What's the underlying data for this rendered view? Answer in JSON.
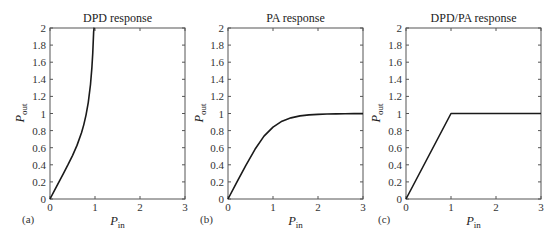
{
  "figure": {
    "background": "#ffffff",
    "curve_color": "#1a1a1a",
    "axis_color": "#555555"
  },
  "chart_data": [
    {
      "panel": "(a)",
      "type": "line",
      "title": "DPD response",
      "xlabel": "P_in",
      "ylabel": "P_out",
      "xlim": [
        0,
        3
      ],
      "ylim": [
        0,
        2
      ],
      "xticks": [
        "0",
        "1",
        "2",
        "3"
      ],
      "yticks": [
        "0",
        "0.2",
        "0.4",
        "0.6",
        "0.8",
        "1",
        "1.2",
        "1.4",
        "1.6",
        "1.8",
        "2"
      ],
      "grid": false,
      "series": [
        {
          "name": "DPD",
          "x": [
            0,
            0.1,
            0.2,
            0.3,
            0.4,
            0.5,
            0.6,
            0.7,
            0.75,
            0.8,
            0.85,
            0.9,
            0.93,
            0.95,
            0.97,
            0.98,
            0.985
          ],
          "y": [
            0,
            0.1,
            0.2,
            0.3,
            0.401,
            0.508,
            0.627,
            0.774,
            0.867,
            0.981,
            1.128,
            1.339,
            1.53,
            1.705,
            1.957,
            2.0,
            2.0
          ]
        }
      ]
    },
    {
      "panel": "(b)",
      "type": "line",
      "title": "PA response",
      "xlabel": "P_in",
      "ylabel": "P_out",
      "xlim": [
        0,
        3
      ],
      "ylim": [
        0,
        2
      ],
      "xticks": [
        "0",
        "1",
        "2",
        "3"
      ],
      "yticks": [
        "0",
        "0.2",
        "0.4",
        "0.6",
        "0.8",
        "1",
        "1.2",
        "1.4",
        "1.6",
        "1.8",
        "2"
      ],
      "grid": false,
      "series": [
        {
          "name": "PA",
          "x": [
            0,
            0.2,
            0.4,
            0.6,
            0.8,
            1.0,
            1.2,
            1.4,
            1.6,
            1.8,
            2.0,
            2.2,
            2.4,
            2.6,
            2.8,
            3.0
          ],
          "y": [
            0,
            0.2,
            0.397,
            0.581,
            0.735,
            0.841,
            0.91,
            0.949,
            0.972,
            0.984,
            0.99,
            0.994,
            0.996,
            0.997,
            0.998,
            0.999
          ]
        }
      ]
    },
    {
      "panel": "(c)",
      "type": "line",
      "title": "DPD/PA response",
      "xlabel": "P_in",
      "ylabel": "P_out",
      "xlim": [
        0,
        3
      ],
      "ylim": [
        0,
        2
      ],
      "xticks": [
        "0",
        "1",
        "2",
        "3"
      ],
      "yticks": [
        "0",
        "0.2",
        "0.4",
        "0.6",
        "0.8",
        "1",
        "1.2",
        "1.4",
        "1.6",
        "1.8",
        "2"
      ],
      "grid": false,
      "series": [
        {
          "name": "DPD/PA",
          "x": [
            0,
            1,
            3
          ],
          "y": [
            0,
            1,
            1
          ]
        }
      ]
    }
  ],
  "panels": [
    {
      "title": "DPD response",
      "label": "(a)",
      "xlabel_main": "P",
      "xlabel_sub": "in",
      "ylabel_main": "P",
      "ylabel_sub": "out"
    },
    {
      "title": "PA response",
      "label": "(b)",
      "xlabel_main": "P",
      "xlabel_sub": "in",
      "ylabel_main": "P",
      "ylabel_sub": "out"
    },
    {
      "title": "DPD/PA response",
      "label": "(c)",
      "xlabel_main": "P",
      "xlabel_sub": "in",
      "ylabel_main": "P",
      "ylabel_sub": "out"
    }
  ]
}
